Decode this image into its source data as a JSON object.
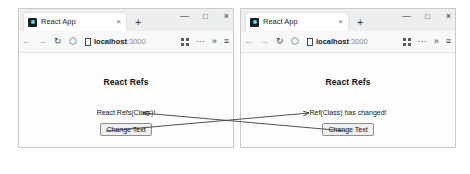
{
  "windows": [
    {
      "id": "left",
      "tab": {
        "title": "React App",
        "favicon": "react-logo-icon",
        "close": "×"
      },
      "newtab": "+",
      "controls": {
        "minimize": "—",
        "maximize": "□",
        "close": "×"
      },
      "toolbar": {
        "back": "←",
        "forward": "→",
        "reload": "↻",
        "shield": "⬡",
        "page_icon": "page-icon",
        "url_host": "localhost",
        "url_port": ":3000",
        "collections": "grid-icon",
        "more": "···",
        "overflow": "»",
        "menu": "≡"
      },
      "page": {
        "heading": "React Refs",
        "text": "React Refs(Class)!",
        "button": "Change Text"
      }
    },
    {
      "id": "right",
      "tab": {
        "title": "React App",
        "favicon": "react-logo-icon",
        "close": "×"
      },
      "newtab": "+",
      "controls": {
        "minimize": "—",
        "maximize": "□",
        "close": "×"
      },
      "toolbar": {
        "back": "←",
        "forward": "→",
        "reload": "↻",
        "shield": "⬡",
        "page_icon": "page-icon",
        "url_host": "localhost",
        "url_port": ":3000",
        "collections": "grid-icon",
        "more": "···",
        "overflow": "»",
        "menu": "≡"
      },
      "page": {
        "heading": "React Refs",
        "text": "Ref(Class) has changed!",
        "button": "Change Text"
      }
    }
  ],
  "annotations": {
    "line_color": "#3d3d3d",
    "connectors": [
      {
        "name": "right-button-to-left-text",
        "from_x": 346,
        "from_y": 131,
        "to_x": 143,
        "to_y": 113
      },
      {
        "name": "left-button-to-right-text",
        "from_x": 106,
        "from_y": 131,
        "to_x": 309,
        "to_y": 113
      }
    ]
  },
  "caption": {
    "text": ""
  }
}
